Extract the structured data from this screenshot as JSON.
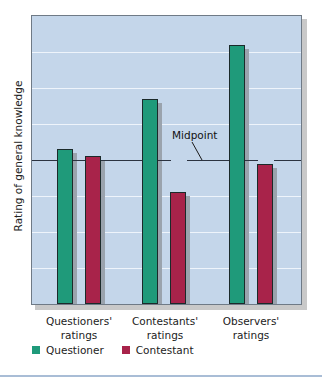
{
  "chart_data": {
    "type": "bar",
    "title": "",
    "xlabel": "",
    "ylabel": "Rating of general knowledge",
    "categories": [
      "Questioners' ratings",
      "Contestants' ratings",
      "Observers' ratings"
    ],
    "category_lines": [
      [
        "Questioners'",
        "ratings"
      ],
      [
        "Contestants'",
        "ratings"
      ],
      [
        "Observers'",
        "ratings"
      ]
    ],
    "series": [
      {
        "name": "Questioner",
        "color": "#1f9a7a",
        "values": [
          4.3,
          5.7,
          7.2
        ]
      },
      {
        "name": "Contestant",
        "color": "#a8234a",
        "values": [
          4.1,
          3.1,
          3.9
        ]
      }
    ],
    "ylim": [
      0,
      8
    ],
    "gridlines": [
      1,
      2,
      3,
      5,
      6,
      7
    ],
    "reference_line": {
      "value": 4,
      "label": "Midpoint"
    },
    "grid": true,
    "y_tick_labels_shown": false,
    "legend_position": "bottom-left"
  },
  "colors": {
    "plot_background": "#c4d6ea",
    "questioner": "#1f9a7a",
    "contestant": "#a8234a"
  }
}
